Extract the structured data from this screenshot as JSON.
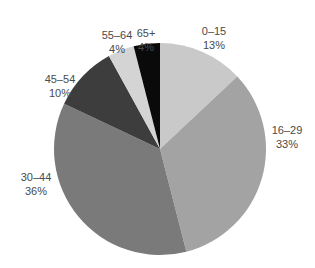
{
  "chart_data": {
    "type": "pie",
    "title": "",
    "categories": [
      "0–15",
      "16–29",
      "30–44",
      "45–54",
      "55–64",
      "65+"
    ],
    "values": [
      13,
      33,
      36,
      10,
      4,
      4
    ],
    "value_labels": [
      "13%",
      "33%",
      "36%",
      "10%",
      "4%",
      "4%"
    ],
    "colors": [
      "#c9c9c9",
      "#a3a3a3",
      "#7a7a7a",
      "#3d3d3d",
      "#d4d4d4",
      "#0a0a0a"
    ],
    "start_angle_deg": 0,
    "direction": "clockwise",
    "legend": "none",
    "labels_position": "outside",
    "center": [
      160,
      149
    ],
    "radius": 106,
    "label_positions": [
      [
        214,
        24
      ],
      [
        287,
        123
      ],
      [
        36,
        170
      ],
      [
        60,
        72
      ],
      [
        117,
        28
      ],
      [
        146,
        26
      ]
    ]
  }
}
